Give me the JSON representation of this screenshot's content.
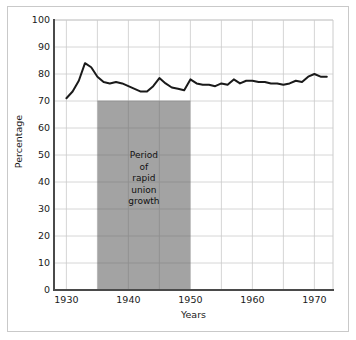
{
  "chart_data": {
    "type": "line",
    "title": "",
    "xlabel": "Years",
    "ylabel": "Percentage",
    "xlim": [
      1928,
      1973
    ],
    "ylim": [
      0,
      100
    ],
    "grid": true,
    "legend": "none",
    "x_ticks": [
      1930,
      1940,
      1950,
      1960,
      1970
    ],
    "x_gridlines": [
      1930,
      1935,
      1940,
      1945,
      1950,
      1955,
      1960,
      1965,
      1970
    ],
    "y_ticks": [
      0,
      10,
      20,
      30,
      40,
      50,
      60,
      70,
      80,
      90,
      100
    ],
    "series": [
      {
        "name": "Percentage",
        "color": "#1a1a1a",
        "x": [
          1930,
          1931,
          1932,
          1933,
          1934,
          1935,
          1936,
          1937,
          1938,
          1939,
          1940,
          1941,
          1942,
          1943,
          1944,
          1945,
          1946,
          1947,
          1948,
          1949,
          1950,
          1951,
          1952,
          1953,
          1954,
          1955,
          1956,
          1957,
          1958,
          1959,
          1960,
          1961,
          1962,
          1963,
          1964,
          1965,
          1966,
          1967,
          1968,
          1969,
          1970,
          1971,
          1972
        ],
        "values": [
          71.0,
          73.5,
          77.5,
          84.0,
          82.5,
          79.0,
          77.0,
          76.5,
          77.0,
          76.5,
          75.5,
          74.5,
          73.5,
          73.5,
          75.5,
          78.5,
          76.5,
          75.0,
          74.5,
          74.0,
          78.0,
          76.5,
          76.0,
          76.0,
          75.5,
          76.5,
          76.0,
          78.0,
          76.5,
          77.5,
          77.5,
          77.0,
          77.0,
          76.5,
          76.5,
          76.0,
          76.5,
          77.5,
          77.0,
          79.0,
          80.0,
          79.0,
          79.0
        ]
      }
    ],
    "shaded_region": {
      "x_start": 1935,
      "x_end": 1950,
      "y_start": 0,
      "y_end": 70,
      "color": "#a3a3a3",
      "label_lines": [
        "Period",
        "of",
        "rapid",
        "union",
        "growth"
      ]
    }
  },
  "axes": {
    "y_title": "Percentage",
    "x_title": "Years",
    "y_tick_labels": [
      "100",
      "90",
      "80",
      "70",
      "60",
      "50",
      "40",
      "30",
      "20",
      "10",
      "0"
    ],
    "x_tick_labels": [
      "1930",
      "1940",
      "1950",
      "1960",
      "1970"
    ]
  },
  "annotation": {
    "line1": "Period",
    "line2": "of",
    "line3": "rapid",
    "line4": "union",
    "line5": "growth"
  },
  "colors": {
    "line": "#1a1a1a",
    "shade": "#a3a3a3",
    "grid": "#cccccc",
    "axis": "#4a4a4a",
    "frame": "#c9c9c9",
    "background": "#ffffff"
  }
}
